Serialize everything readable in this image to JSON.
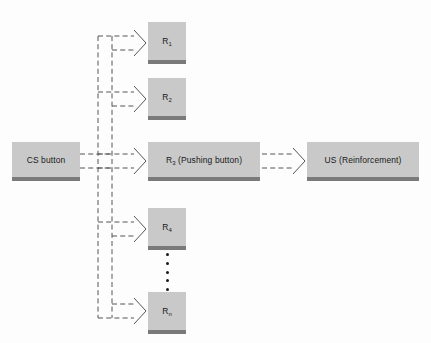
{
  "diagram": {
    "type": "flow-diagram",
    "background_color": "#fdfdfd",
    "box_fill_color": "#c9c9c9",
    "box_base_color": "#7a7a7a",
    "connector_color": "#555555",
    "connector_style": "dashed-outline-arrow"
  },
  "nodes": {
    "cs": {
      "label": "CS button"
    },
    "r1": {
      "label": "R",
      "sub": "1"
    },
    "r2": {
      "label": "R",
      "sub": "2"
    },
    "r3": {
      "label": "R",
      "sub": "3",
      "suffix": " (Pushing button)"
    },
    "r4": {
      "label": "R",
      "sub": "4"
    },
    "rn": {
      "label": "R",
      "sub": "n"
    },
    "us": {
      "label": "US (Reinforcement)"
    }
  },
  "ellipsis": {
    "dot_count": 5,
    "meaning": "continuation of response series"
  },
  "edges": [
    {
      "from": "cs",
      "to": "r1",
      "style": "dashed-outline-arrow"
    },
    {
      "from": "cs",
      "to": "r2",
      "style": "dashed-outline-arrow"
    },
    {
      "from": "cs",
      "to": "r3",
      "style": "dashed-outline-arrow"
    },
    {
      "from": "cs",
      "to": "r4",
      "style": "dashed-outline-arrow"
    },
    {
      "from": "cs",
      "to": "rn",
      "style": "dashed-outline-arrow"
    },
    {
      "from": "r3",
      "to": "us",
      "style": "dashed-outline-arrow"
    }
  ]
}
